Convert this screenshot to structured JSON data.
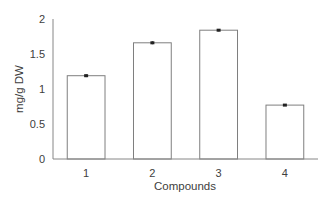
{
  "chart_data": {
    "type": "bar",
    "title": "",
    "xlabel": "Compounds",
    "ylabel": "mg/g DW",
    "categories": [
      "1",
      "2",
      "3",
      "4"
    ],
    "values": [
      1.19,
      1.66,
      1.84,
      0.77
    ],
    "error": [
      0.02,
      0.02,
      0.015,
      0.01
    ],
    "ylim": [
      0,
      2
    ],
    "yticks": [
      0,
      0.5,
      1,
      1.5,
      2
    ],
    "ytick_labels": [
      "0",
      "0.5",
      "1",
      "1.5",
      "2"
    ],
    "grid": false,
    "legend": null,
    "bar_fill": "#ffffff",
    "bar_stroke": "#7f7f7f",
    "axis_color": "#868686",
    "error_color": "#000000"
  }
}
